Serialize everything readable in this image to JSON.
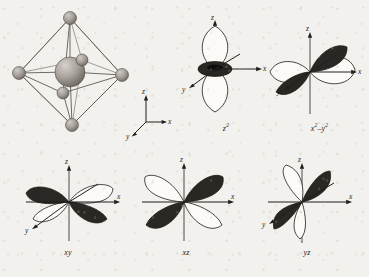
{
  "figure": {
    "background_color": "#f2f1ed",
    "ink_color": "#211e1c",
    "lobe_dark_color": "#2a2724",
    "lobe_light_color": "#fbfaf7",
    "sphere_color": "#9c9691"
  },
  "panels": [
    {
      "id": "octahedron",
      "name": "octahedral-complex",
      "caption": "",
      "axes": [
        {
          "label": "z",
          "direction": "up"
        },
        {
          "label": "x",
          "direction": "right"
        },
        {
          "label": "y",
          "direction": "lower-left"
        }
      ],
      "spheres": {
        "center_label": "metal-center",
        "vertex_count": 6,
        "description": "six ligand spheres at octahedral vertices around a larger central sphere"
      }
    },
    {
      "id": "z2",
      "name": "orbital-z2",
      "caption_parts": {
        "base": "z",
        "exponent": "2"
      },
      "caption": "z2",
      "axes": [
        {
          "label": "z",
          "direction": "up"
        },
        {
          "label": "x",
          "direction": "right"
        },
        {
          "label": "y",
          "direction": "lower-left"
        }
      ],
      "lobes": {
        "dark_count": 1,
        "light_count": 2,
        "description": "two light lobes along z with a dark torus ring at the origin"
      }
    },
    {
      "id": "x2-y2",
      "name": "orbital-x2-y2",
      "caption_parts": {
        "base1": "x",
        "exponent1": "2",
        "minus": "–",
        "base2": "y",
        "exponent2": "2"
      },
      "caption": "x2 – y2",
      "axes": [
        {
          "label": "z",
          "direction": "up"
        },
        {
          "label": "x",
          "direction": "right"
        },
        {
          "label": "y",
          "direction": "lower-left"
        }
      ],
      "lobes": {
        "dark_count": 2,
        "light_count": 2,
        "description": "four lobes along the x and y axes, dark along y and light along x"
      }
    },
    {
      "id": "xy",
      "name": "orbital-xy",
      "caption": "xy",
      "axes": [
        {
          "label": "z",
          "direction": "up"
        },
        {
          "label": "x",
          "direction": "right"
        },
        {
          "label": "y",
          "direction": "lower-left"
        }
      ],
      "lobes": {
        "dark_count": 2,
        "light_count": 2,
        "description": "four lobes lying between the x and y axes"
      }
    },
    {
      "id": "xz",
      "name": "orbital-xz",
      "caption": "xz",
      "axes": [
        {
          "label": "z",
          "direction": "up"
        },
        {
          "label": "x",
          "direction": "right"
        }
      ],
      "lobes": {
        "dark_count": 2,
        "light_count": 2,
        "description": "four-lobed clover between the x and z axes"
      }
    },
    {
      "id": "yz",
      "name": "orbital-yz",
      "caption": "yz",
      "axes": [
        {
          "label": "z",
          "direction": "up"
        },
        {
          "label": "x",
          "direction": "right"
        },
        {
          "label": "y",
          "direction": "lower-left"
        }
      ],
      "lobes": {
        "dark_count": 2,
        "light_count": 2,
        "description": "four lobes between the y and z axes"
      }
    }
  ],
  "axis_labels": {
    "x": "x",
    "y": "y",
    "z": "z"
  }
}
